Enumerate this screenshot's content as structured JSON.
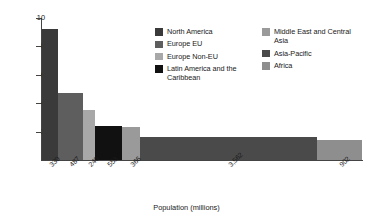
{
  "chart_data": {
    "type": "bar",
    "title": "",
    "xlabel": "Population (millions)",
    "ylabel": "Ecological Footprint (gha per person)",
    "ylim": [
      0,
      10
    ],
    "y_ticks": [
      "10",
      "8",
      "6",
      "4",
      "2"
    ],
    "y_tick_values": [
      10,
      8,
      6,
      4,
      2
    ],
    "grid": false,
    "legend_position": "upper-right",
    "note": "Variable-width bar chart: bar width = population (millions), bar height = ecological footprint (gha per person)",
    "categories": [
      "North America",
      "Europe EU",
      "Europe Non-EU",
      "Latin America and the Caribbean",
      "Middle East and Central Asia",
      "Asia-Pacific",
      "Africa"
    ],
    "x_tick_labels": [
      "330",
      "487",
      "240",
      "553",
      "366",
      "3,562",
      "902"
    ],
    "widths": [
      330,
      487,
      240,
      553,
      366,
      3562,
      902
    ],
    "values": [
      9.2,
      4.7,
      3.5,
      2.4,
      2.3,
      1.6,
      1.4
    ],
    "colors": [
      "#3a3a3a",
      "#5e5e5e",
      "#a8a8a8",
      "#111111",
      "#9a9a9a",
      "#4a4a4a",
      "#8e8e8e"
    ],
    "series": [
      {
        "name": "Ecological Footprint (gha per person)",
        "values": [
          9.2,
          4.7,
          3.5,
          2.4,
          2.3,
          1.6,
          1.4
        ]
      }
    ]
  },
  "legend": {
    "left_column": [
      {
        "label": "North America",
        "color": "#3a3a3a"
      },
      {
        "label": "Europe EU",
        "color": "#5e5e5e"
      },
      {
        "label": "Europe Non-EU",
        "color": "#a8a8a8"
      },
      {
        "label": "Latin America and the Caribbean",
        "color": "#111111"
      }
    ],
    "right_column": [
      {
        "label": "Middle East and Central Asia",
        "color": "#9a9a9a"
      },
      {
        "label": "Asia-Pacific",
        "color": "#4a4a4a"
      },
      {
        "label": "Africa",
        "color": "#8e8e8e"
      }
    ]
  }
}
